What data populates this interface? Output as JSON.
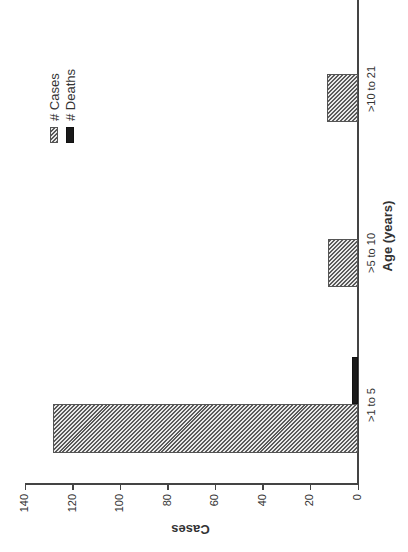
{
  "chart_data": {
    "type": "bar",
    "title": "",
    "xlabel": "Age (years)",
    "ylabel": "Cases",
    "categories": [
      ">1 to 5",
      ">5 to 10",
      ">10 to 21"
    ],
    "series": [
      {
        "name": "# Cases",
        "values": [
          128,
          12,
          12
        ],
        "pattern": "hatched",
        "color": "#5a5a5a"
      },
      {
        "name": "# Deaths",
        "values": [
          2,
          0,
          0
        ],
        "pattern": "solid",
        "color": "#1a1a1a"
      }
    ],
    "ylim": [
      0,
      140
    ],
    "yticks": [
      0,
      20,
      40,
      60,
      80,
      100,
      120,
      140
    ],
    "grid": false,
    "legend_position": "upper right",
    "orientation_note": "figure rotated 90 degrees counterclockwise"
  },
  "axis": {
    "x_title": "Age (years)",
    "y_title": "Cases",
    "y_ticks": [
      "0",
      "20",
      "40",
      "60",
      "80",
      "100",
      "120",
      "140"
    ],
    "categories": [
      ">1 to 5",
      ">5 to 10",
      ">10 to 21"
    ]
  },
  "legend": {
    "cases": "# Cases",
    "deaths": "# Deaths"
  }
}
